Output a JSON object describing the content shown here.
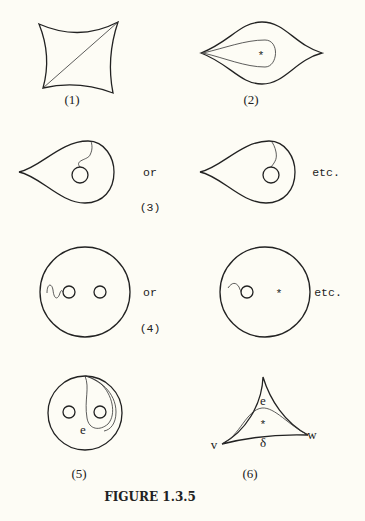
{
  "figure": {
    "caption": "FIGURE 1.3.5",
    "panels": [
      {
        "id": "1",
        "label": "(1)",
        "shape": "curved-quadrilateral-with-diagonal"
      },
      {
        "id": "2",
        "label": "(2)",
        "shape": "lens-with-inner-loop-around-puncture",
        "marks": [
          "*"
        ]
      },
      {
        "id": "3",
        "label": "(3)",
        "shape": "teardrop-with-disk-and-arc",
        "connectors": [
          "or",
          "etc."
        ]
      },
      {
        "id": "4",
        "label": "(4)",
        "shape": "disk-with-two-holes",
        "connectors": [
          "or",
          "etc."
        ],
        "marks": [
          "*"
        ]
      },
      {
        "id": "5",
        "label": "(5)",
        "shape": "disk-with-two-holes-and-loop",
        "marks": [
          "e"
        ]
      },
      {
        "id": "6",
        "label": "(6)",
        "shape": "curved-triangle",
        "marks": [
          "e",
          "*",
          "δ",
          "v",
          "w"
        ]
      }
    ],
    "text": {
      "label_1": "(1)",
      "label_2": "(2)",
      "label_3": "(3)",
      "label_4": "(4)",
      "label_5": "(5)",
      "label_6": "(6)",
      "or_3": "or",
      "etc_3": "etc.",
      "or_4": "or",
      "etc_4": "etc.",
      "star_2": "*",
      "star_4": "*",
      "e_5": "e",
      "e_6": "e",
      "star_6": "*",
      "delta_6": "δ",
      "v_6": "v",
      "w_6": "w"
    }
  }
}
